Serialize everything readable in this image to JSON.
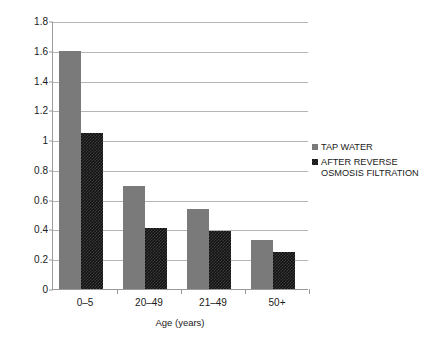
{
  "chart_data": {
    "type": "bar",
    "title": "",
    "xlabel": "Age (years)",
    "ylabel": "Incidence of HCGI",
    "categories": [
      "0–5",
      "20–49",
      "21–49",
      "50+"
    ],
    "series": [
      {
        "name": "TAP WATER",
        "values": [
          1.6,
          0.69,
          0.54,
          0.33
        ],
        "color": "#7a7a7a"
      },
      {
        "name": "AFTER REVERSE\nOSMOSIS FILTRATION",
        "values": [
          1.05,
          0.41,
          0.39,
          0.25
        ],
        "color": "#111111"
      }
    ],
    "ylim": [
      0,
      1.8
    ],
    "ytick_labels": [
      "0",
      "0.2",
      "0.4",
      "0.6",
      "0.8",
      "1",
      "1.2",
      "1.4",
      "1.6",
      "1.8"
    ],
    "ytick_values": [
      0,
      0.2,
      0.4,
      0.6,
      0.8,
      1,
      1.2,
      1.4,
      1.6,
      1.8
    ],
    "grid": true,
    "legend_position": "right"
  },
  "legend": {
    "entries": [
      {
        "label": "TAP WATER"
      },
      {
        "label": "AFTER REVERSE\nOSMOSIS FILTRATION"
      }
    ]
  }
}
